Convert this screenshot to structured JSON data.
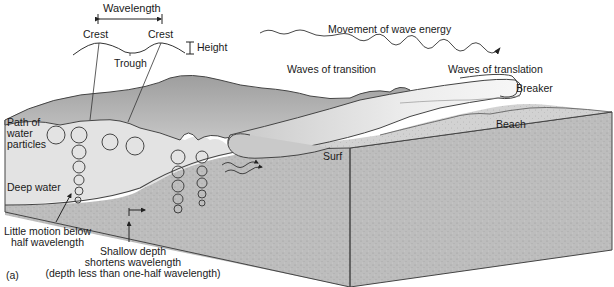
{
  "figure": {
    "panel_label": "(a)",
    "colors": {
      "water_surface_dark": "#a8a8a8",
      "water_surface_light": "#d4d4d4",
      "water_body": "#e4e4e4",
      "sediment_front": "#c2c2c2",
      "sediment_top": "#d0d0d0",
      "sediment_side": "#b5b5b5",
      "line": "#333333",
      "foam": "#f2f2f2"
    }
  },
  "wave_profile": {
    "wavelength_label": "Wavelength",
    "crest_left_label": "Crest",
    "crest_right_label": "Crest",
    "trough_label": "Trough",
    "height_label": "Height"
  },
  "energy": {
    "label": "Movement of wave energy"
  },
  "zones": {
    "transition_label": "Waves of transition",
    "translation_label": "Waves of translation",
    "breaker_label": "Breaker",
    "beach_label": "Beach",
    "surf_label": "Surf"
  },
  "annotations": {
    "path_label_line1": "Path of",
    "path_label_line2": "water",
    "path_label_line3": "particles",
    "deep_water_label": "Deep water",
    "little_motion_line1": "Little motion below",
    "little_motion_line2": "half wavelength",
    "shallow_line1": "Shallow depth",
    "shallow_line2": "shortens wavelength",
    "shallow_line3": "(depth less than one-half wavelength)"
  }
}
